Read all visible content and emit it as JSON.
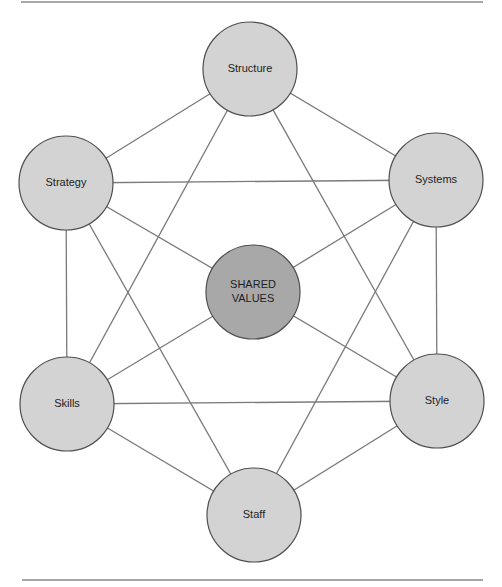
{
  "diagram": {
    "title": "",
    "colors": {
      "outer_fill": "#d3d3d3",
      "center_fill": "#a8a8a8",
      "edge": "#7a7a7a",
      "outline": "#4f4f4f",
      "rule": "#8a8a8a"
    },
    "rules": [
      {
        "x1": 21,
        "y1": 2,
        "x2": 483,
        "y2": 2
      },
      {
        "x1": 22,
        "y1": 580,
        "x2": 483,
        "y2": 580
      }
    ],
    "node_radius": 47,
    "nodes": [
      {
        "id": "structure",
        "label": "Structure",
        "lines": [
          "Structure"
        ],
        "cx": 250,
        "cy": 69,
        "center": false
      },
      {
        "id": "strategy",
        "label": "Strategy",
        "lines": [
          "Strategy"
        ],
        "cx": 66,
        "cy": 183,
        "center": false
      },
      {
        "id": "systems",
        "label": "Systems",
        "lines": [
          "Systems"
        ],
        "cx": 436,
        "cy": 180,
        "center": false
      },
      {
        "id": "shared_values",
        "label": "SHARED VALUES",
        "lines": [
          "SHARED",
          "VALUES"
        ],
        "cx": 253,
        "cy": 292,
        "center": true
      },
      {
        "id": "skills",
        "label": "Skills",
        "lines": [
          "Skills"
        ],
        "cx": 67,
        "cy": 404,
        "center": false
      },
      {
        "id": "style",
        "label": "Style",
        "lines": [
          "Style"
        ],
        "cx": 437,
        "cy": 401,
        "center": false
      },
      {
        "id": "staff",
        "label": "Staff",
        "lines": [
          "Staff"
        ],
        "cx": 254,
        "cy": 515,
        "center": false
      }
    ],
    "edges": [
      [
        "structure",
        "strategy"
      ],
      [
        "structure",
        "systems"
      ],
      [
        "structure",
        "skills"
      ],
      [
        "structure",
        "style"
      ],
      [
        "strategy",
        "systems"
      ],
      [
        "strategy",
        "skills"
      ],
      [
        "strategy",
        "staff"
      ],
      [
        "strategy",
        "shared_values"
      ],
      [
        "systems",
        "style"
      ],
      [
        "systems",
        "staff"
      ],
      [
        "systems",
        "shared_values"
      ],
      [
        "skills",
        "style"
      ],
      [
        "skills",
        "staff"
      ],
      [
        "skills",
        "shared_values"
      ],
      [
        "style",
        "staff"
      ],
      [
        "style",
        "shared_values"
      ]
    ]
  }
}
